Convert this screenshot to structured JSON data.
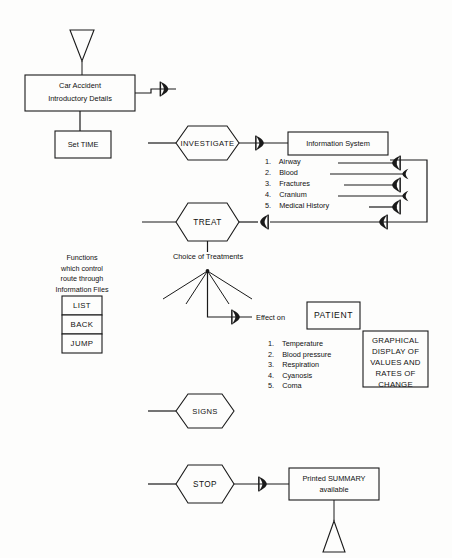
{
  "diagram": {
    "nodes": {
      "start_terminator": {
        "name": "start-terminator",
        "shape": "triangle-down"
      },
      "intro": {
        "line1": "Car Accident",
        "line2": "Introductory Details"
      },
      "set_time": {
        "label": "Set TIME"
      },
      "investigate": {
        "label": "INVESTIGATE"
      },
      "information_system": {
        "label": "Information System"
      },
      "treat": {
        "label": "TREAT"
      },
      "choice_of_treatments": {
        "label": "Choice of Treatments"
      },
      "effect_on": {
        "label": "Effect on"
      },
      "patient": {
        "label": "PATIENT"
      },
      "graphical_display": {
        "lines": [
          "GRAPHICAL",
          "DISPLAY OF",
          "VALUES AND",
          "RATES  OF",
          "CHANGE"
        ]
      },
      "signs": {
        "label": "SIGNS"
      },
      "stop": {
        "label": "STOP"
      },
      "printed_summary": {
        "line1": "Printed SUMMARY",
        "line2": "available"
      },
      "end_terminator": {
        "name": "end-terminator",
        "shape": "triangle-up"
      }
    },
    "investigation_items": [
      {
        "num": "1.",
        "label": "Airway"
      },
      {
        "num": "2.",
        "label": "Blood"
      },
      {
        "num": "3.",
        "label": "Fractures"
      },
      {
        "num": "4.",
        "label": "Cranium"
      },
      {
        "num": "5.",
        "label": "Medical History"
      }
    ],
    "patient_sign_items": [
      {
        "num": "1.",
        "label": "Temperature"
      },
      {
        "num": "2.",
        "label": "Blood pressure"
      },
      {
        "num": "3.",
        "label": "Respiration"
      },
      {
        "num": "4.",
        "label": "Cyanosis"
      },
      {
        "num": "5.",
        "label": "Coma"
      }
    ],
    "functions_note": {
      "lines": [
        "Functions",
        "which control",
        "route through",
        "Information Files"
      ]
    },
    "function_buttons": [
      {
        "label": "LIST"
      },
      {
        "label": "BACK"
      },
      {
        "label": "JUMP"
      }
    ],
    "colors": {
      "ink": "#1a1a1a",
      "paper": "#fdfdfc"
    }
  }
}
